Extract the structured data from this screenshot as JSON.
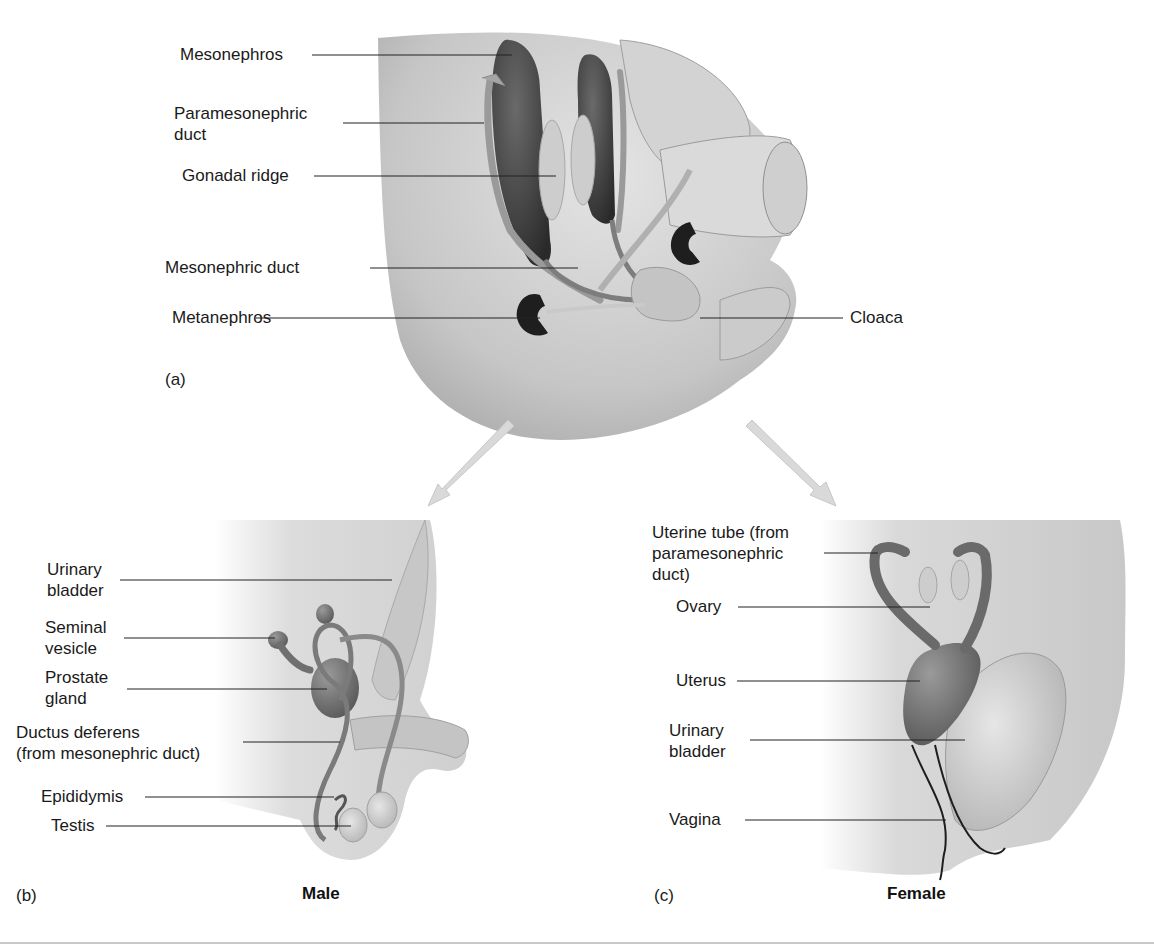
{
  "figure": {
    "panels": [
      {
        "id": "a",
        "letter": "(a)",
        "labels": {
          "mesonephros": "Mesonephros",
          "paramesonephric_duct": "Paramesonephric\nduct",
          "gonadal_ridge": "Gonadal ridge",
          "mesonephric_duct": "Mesonephric duct",
          "metanephros": "Metanephros",
          "cloaca": "Cloaca"
        }
      },
      {
        "id": "b",
        "letter": "(b)",
        "caption": "Male",
        "labels": {
          "urinary_bladder": "Urinary\nbladder",
          "seminal_vesicle": "Seminal\nvesicle",
          "prostate_gland": "Prostate\ngland",
          "ductus_deferens": "Ductus deferens\n(from mesonephric duct)",
          "epididymis": "Epididymis",
          "testis": "Testis"
        }
      },
      {
        "id": "c",
        "letter": "(c)",
        "caption": "Female",
        "labels": {
          "uterine_tube": "Uterine tube (from\nparamesonephric\nduct)",
          "ovary": "Ovary",
          "uterus": "Uterus",
          "urinary_bladder": "Urinary\nbladder",
          "vagina": "Vagina"
        }
      }
    ],
    "arrows": [
      "arrow-to-male",
      "arrow-to-female"
    ],
    "colors": {
      "tissue_light": "#d8d8d8",
      "tissue_mid": "#b5b5b5",
      "organ_dark": "#4a4a4a",
      "organ_darkest": "#1e1e1e",
      "gonad_light": "#cfcfcf",
      "leader_line": "#222222",
      "arrow": "#d9d9d9",
      "rule": "#c9c9c9"
    }
  }
}
